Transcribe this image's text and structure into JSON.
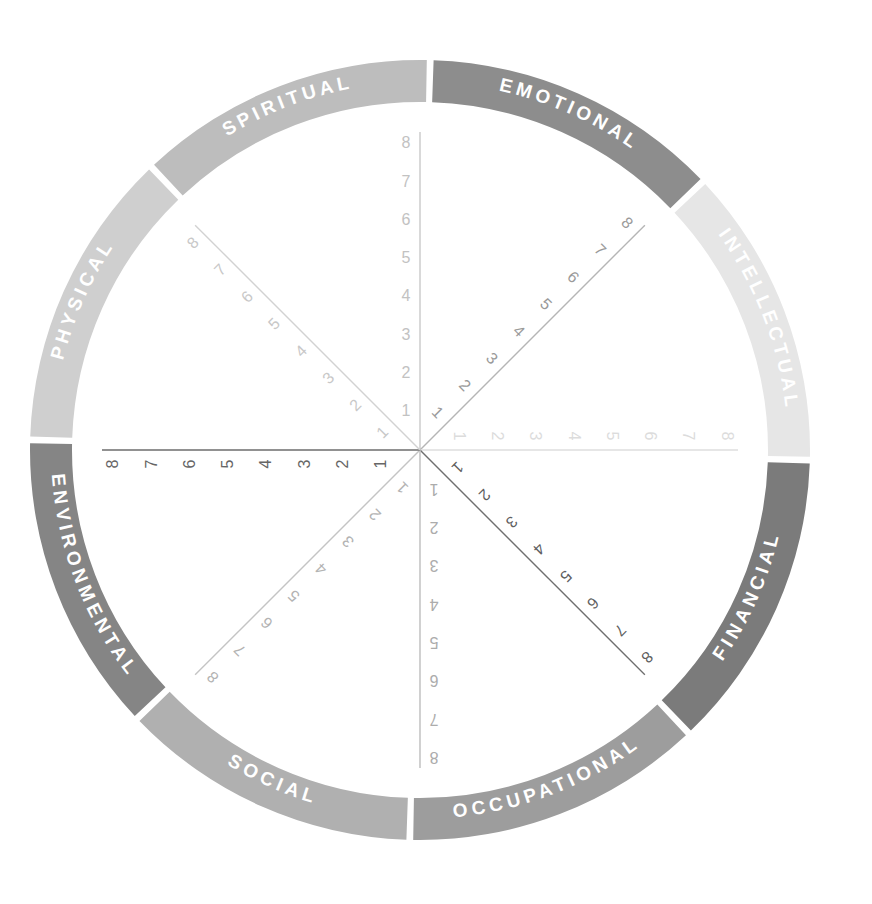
{
  "chart_data": {
    "type": "pie",
    "subtitle": "",
    "xlabel": "",
    "ylabel": "",
    "scale_min": 1,
    "scale_max": 8,
    "tick_labels": [
      "1",
      "2",
      "3",
      "4",
      "5",
      "6",
      "7",
      "8"
    ],
    "grid": false,
    "legend_position": "ring",
    "categories": [
      "EMOTIONAL",
      "INTELLECTUAL",
      "FINANCIAL",
      "OCCUPATIONAL",
      "SOCIAL",
      "ENVIRONMENTAL",
      "PHYSICAL",
      "SPIRITUAL"
    ],
    "values": [
      0,
      0,
      0,
      0,
      0,
      0,
      0,
      0
    ],
    "slice_colors": [
      "#8d8d8d",
      "#e6e6e6",
      "#7b7b7b",
      "#9d9d9d",
      "#b0b0b0",
      "#858585",
      "#cfcfcf",
      "#bdbdbd"
    ],
    "axes_count": 8,
    "axis_tick_count": 8
  },
  "wheel": {
    "center_x": 420,
    "center_y": 450,
    "outer_radius": 390,
    "inner_radius": 348,
    "gap_degrees": 2.0,
    "axis_length": 318,
    "segments": [
      {
        "id": "emotional",
        "label": "EMOTIONAL",
        "color": "#8d8d8d",
        "text_color": "#ffffff",
        "start_deg": -88,
        "end_deg": -44
      },
      {
        "id": "intellectual",
        "label": "INTELLECTUAL",
        "color": "#e6e6e6",
        "text_color": "#ffffff",
        "start_deg": -43,
        "end_deg": 1
      },
      {
        "id": "financial",
        "label": "FINANCIAL",
        "color": "#7b7b7b",
        "text_color": "#ffffff",
        "start_deg": 2,
        "end_deg": 46
      },
      {
        "id": "occupational",
        "label": "OCCUPATIONAL",
        "color": "#9d9d9d",
        "text_color": "#ffffff",
        "start_deg": 47,
        "end_deg": 91
      },
      {
        "id": "social",
        "label": "SOCIAL",
        "color": "#b0b0b0",
        "text_color": "#ffffff",
        "start_deg": 92,
        "end_deg": 136
      },
      {
        "id": "environmental",
        "label": "ENVIRONMENTAL",
        "color": "#858585",
        "text_color": "#ffffff",
        "start_deg": 137,
        "end_deg": 181
      },
      {
        "id": "physical",
        "label": "PHYSICAL",
        "color": "#cfcfcf",
        "text_color": "#ffffff",
        "start_deg": 182,
        "end_deg": 226
      },
      {
        "id": "spiritual",
        "label": "SPIRITUAL",
        "color": "#bdbdbd",
        "text_color": "#ffffff",
        "start_deg": 227,
        "end_deg": 271
      }
    ],
    "axes": [
      {
        "id": "axis-up",
        "name": "axis-emotional-spiritual",
        "angle_deg": -90,
        "line_color": "#c9c9c9",
        "text_color": "#c2c2c2",
        "label_side": "left",
        "ticks": [
          "1",
          "2",
          "3",
          "4",
          "5",
          "6",
          "7",
          "8"
        ]
      },
      {
        "id": "axis-up-right",
        "name": "axis-emotional-intellectual",
        "angle_deg": -45,
        "line_color": "#b5b5b5",
        "text_color": "#9a9a9a",
        "label_side": "left",
        "ticks": [
          "1",
          "2",
          "3",
          "4",
          "5",
          "6",
          "7",
          "8"
        ]
      },
      {
        "id": "axis-right",
        "name": "axis-intellectual-financial",
        "angle_deg": 0,
        "line_color": "#dedede",
        "text_color": "#dcdcdc",
        "label_side": "left",
        "ticks": [
          "1",
          "2",
          "3",
          "4",
          "5",
          "6",
          "7",
          "8"
        ]
      },
      {
        "id": "axis-down-right",
        "name": "axis-financial-occupational",
        "angle_deg": 45,
        "line_color": "#6f6f6f",
        "text_color": "#5f5f5f",
        "label_side": "left",
        "ticks": [
          "1",
          "2",
          "3",
          "4",
          "5",
          "6",
          "7",
          "8"
        ]
      },
      {
        "id": "axis-down",
        "name": "axis-occupational-social",
        "angle_deg": 90,
        "line_color": "#bdbdbd",
        "text_color": "#acacac",
        "label_side": "left",
        "ticks": [
          "1",
          "2",
          "3",
          "4",
          "5",
          "6",
          "7",
          "8"
        ]
      },
      {
        "id": "axis-down-left",
        "name": "axis-social-environmental",
        "angle_deg": 135,
        "line_color": "#c4c4c4",
        "text_color": "#b3b3b3",
        "label_side": "left",
        "ticks": [
          "1",
          "2",
          "3",
          "4",
          "5",
          "6",
          "7",
          "8"
        ]
      },
      {
        "id": "axis-left",
        "name": "axis-environmental-physical",
        "angle_deg": 180,
        "line_color": "#6c6c6c",
        "text_color": "#666666",
        "label_side": "left",
        "ticks": [
          "1",
          "2",
          "3",
          "4",
          "5",
          "6",
          "7",
          "8"
        ]
      },
      {
        "id": "axis-up-left",
        "name": "axis-physical-spiritual",
        "angle_deg": -135,
        "line_color": "#d2d2d2",
        "text_color": "#c8c8c8",
        "label_side": "left",
        "ticks": [
          "1",
          "2",
          "3",
          "4",
          "5",
          "6",
          "7",
          "8"
        ]
      }
    ]
  }
}
